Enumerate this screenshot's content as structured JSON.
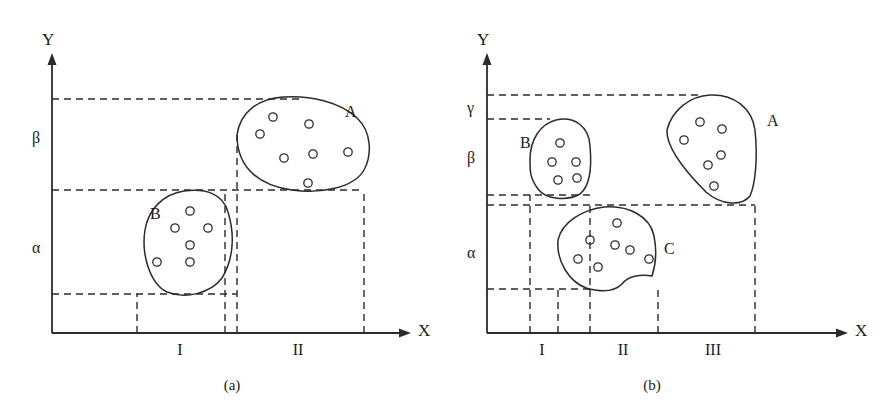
{
  "figure": {
    "background_color": "#ffffff",
    "line_color": "#2b2b2b"
  },
  "panels": [
    {
      "id": "a",
      "caption": "(a)",
      "axes": {
        "x_label": "X",
        "y_label": "Y",
        "origin": [
          52,
          333
        ],
        "x_end": 411,
        "y_top": 53
      },
      "y_tick_labels": [
        {
          "text": "β",
          "y": 140
        },
        {
          "text": "α",
          "y": 250
        }
      ],
      "x_interval_labels": [
        {
          "text": "I",
          "x": 180
        },
        {
          "text": "II",
          "x": 298
        }
      ],
      "y_guides": [
        99,
        190,
        294
      ],
      "x_guides": [
        137,
        225,
        237,
        364
      ],
      "clusters": [
        {
          "name": "A",
          "label_x": 345,
          "label_y": 103,
          "point_count": 7,
          "points": [
            [
              273,
              117
            ],
            [
              309,
              124
            ],
            [
              260,
              134
            ],
            [
              284,
              158
            ],
            [
              313,
              154
            ],
            [
              348,
              152
            ],
            [
              308,
              183
            ]
          ],
          "outline": "M 237,135 C 240,112 258,99 283,97 C 310,95 340,102 357,118 C 372,132 372,155 364,170 C 354,188 320,194 292,190 C 262,186 237,170 237,135 Z"
        },
        {
          "name": "B",
          "label_x": 150,
          "label_y": 205,
          "point_count": 6,
          "points": [
            [
              190,
              211
            ],
            [
              175,
              228
            ],
            [
              208,
              228
            ],
            [
              190,
              245
            ],
            [
              157,
              262
            ],
            [
              190,
              262
            ]
          ],
          "outline": "M 145,230 C 148,210 163,194 184,191 C 206,188 223,194 228,212 C 236,238 232,262 222,278 C 210,294 185,299 167,292 C 150,284 141,254 145,230 Z"
        }
      ]
    },
    {
      "id": "b",
      "caption": "(b)",
      "axes": {
        "x_label": "X",
        "y_label": "Y",
        "origin": [
          487,
          333
        ],
        "x_end": 848,
        "y_top": 53
      },
      "y_tick_labels": [
        {
          "text": "γ",
          "y": 110
        },
        {
          "text": "β",
          "y": 160
        },
        {
          "text": "α",
          "y": 255
        }
      ],
      "x_interval_labels": [
        {
          "text": "I",
          "x": 542
        },
        {
          "text": "II",
          "x": 623
        },
        {
          "text": "III",
          "x": 713
        }
      ],
      "y_guides": [
        95,
        119,
        195,
        205,
        289
      ],
      "x_guides": [
        530,
        558,
        590,
        658,
        755
      ],
      "clusters": [
        {
          "name": "A",
          "label_x": 767,
          "label_y": 112,
          "point_count": 6,
          "points": [
            [
              700,
              122
            ],
            [
              722,
              129
            ],
            [
              684,
              140
            ],
            [
              708,
              165
            ],
            [
              721,
              155
            ],
            [
              714,
              186
            ]
          ],
          "outline": "M 667,130 C 672,110 690,96 710,95 C 734,94 752,108 755,130 C 758,160 755,185 750,196 C 742,206 722,206 706,192 C 690,176 666,150 667,130 Z"
        },
        {
          "name": "B",
          "label_x": 520,
          "label_y": 134,
          "point_count": 5,
          "points": [
            [
              560,
              143
            ],
            [
              552,
              162
            ],
            [
              576,
              162
            ],
            [
              558,
              180
            ],
            [
              577,
              178
            ]
          ],
          "outline": "M 530,160 C 530,140 540,124 556,120 C 574,116 589,126 590,146 C 592,168 590,186 580,194 C 568,201 546,200 538,189 C 530,178 530,172 530,160 Z"
        },
        {
          "name": "C",
          "label_x": 664,
          "label_y": 240,
          "point_count": 7,
          "points": [
            [
              590,
              240
            ],
            [
              615,
              245
            ],
            [
              630,
              250
            ],
            [
              617,
              223
            ],
            [
              578,
              259
            ],
            [
              598,
              267
            ],
            [
              649,
              259
            ]
          ],
          "outline": "M 558,240 C 562,222 582,210 604,207 C 628,205 650,216 654,236 C 658,256 654,270 652,276 C 640,274 628,276 622,284 C 614,292 600,292 586,288 C 570,282 556,262 558,240 Z"
        }
      ]
    }
  ]
}
